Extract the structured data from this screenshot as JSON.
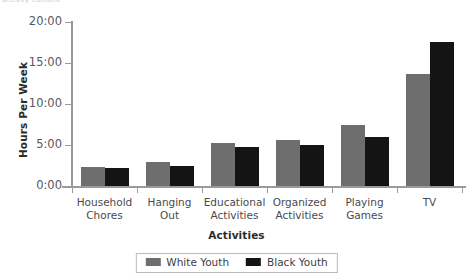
{
  "top_clipped_caption": "activity content",
  "chart_data": {
    "type": "bar",
    "title": "",
    "xlabel": "Activities",
    "ylabel": "Hours Per Week",
    "categories": [
      "Household\nChores",
      "Hanging\nOut",
      "Educational\nActivities",
      "Organized\nActivities",
      "Playing\nGames",
      "TV"
    ],
    "series": [
      {
        "name": "White Youth",
        "color": "#6e6e6e",
        "values": [
          2.3,
          2.9,
          5.3,
          5.6,
          7.4,
          13.6
        ]
      },
      {
        "name": "Black Youth",
        "color": "#141414",
        "values": [
          2.2,
          2.4,
          4.7,
          5.0,
          6.0,
          17.6
        ]
      }
    ],
    "ylim": [
      0,
      20
    ],
    "ytick_values": [
      0,
      5,
      10,
      15,
      20
    ],
    "ytick_labels": [
      "0:00",
      "5:00",
      "10:00",
      "15:00",
      "20:00"
    ],
    "grid": false,
    "legend_position": "bottom-center"
  },
  "legend": {
    "entries": [
      {
        "label": "White Youth"
      },
      {
        "label": "Black Youth"
      }
    ]
  }
}
